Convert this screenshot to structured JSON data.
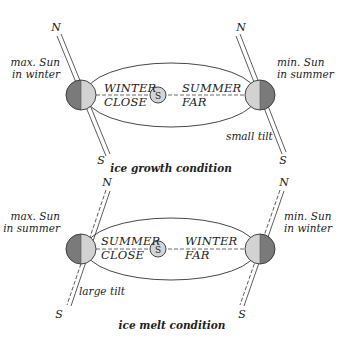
{
  "colors": {
    "orbit": "#333333",
    "planet_dark": "#7a7a7a",
    "planet_light": "#d2d2d2",
    "sun_fill": "#d4d4d4",
    "text": "#222222",
    "background": "#ffffff"
  },
  "panels": [
    {
      "id": "ice-growth",
      "caption": "ice growth condition",
      "sun_label": "S",
      "left": {
        "label_line1": "max. Sun",
        "label_line2": "in winter",
        "orbit_line1": "WINTER",
        "orbit_line2": "CLOSE",
        "north": "N",
        "south": "S"
      },
      "right": {
        "label_line1": "min. Sun",
        "label_line2": "in summer",
        "orbit_line1": "SUMMER",
        "orbit_line2": "FAR",
        "north": "N",
        "south": "S",
        "tilt_note": "small tilt"
      }
    },
    {
      "id": "ice-melt",
      "caption": "ice melt condition",
      "sun_label": "S",
      "left": {
        "label_line1": "max. Sun",
        "label_line2": "in summer",
        "orbit_line1": "SUMMER",
        "orbit_line2": "CLOSE",
        "north": "N",
        "south": "S",
        "tilt_note": "large tilt"
      },
      "right": {
        "label_line1": "min. Sun",
        "label_line2": "in winter",
        "orbit_line1": "WINTER",
        "orbit_line2": "FAR",
        "north": "N",
        "south": "S"
      }
    }
  ]
}
